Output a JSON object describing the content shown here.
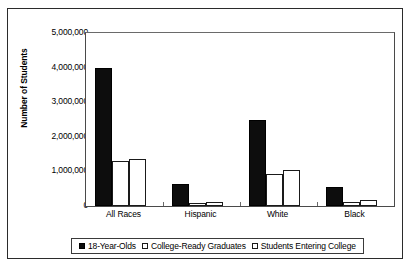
{
  "chart_data": {
    "type": "bar",
    "title": "",
    "subtitle": "",
    "xlabel": "",
    "ylabel": "Number of Students",
    "categories": [
      "All Races",
      "Hispanic",
      "White",
      "Black"
    ],
    "series": [
      {
        "name": "18-Year-Olds",
        "swatch": "filled-black-square",
        "values": [
          4000000,
          650000,
          2500000,
          550000
        ]
      },
      {
        "name": "College-Ready Graduates",
        "swatch": "dotted-white-square",
        "values": [
          1300000,
          80000,
          930000,
          130000
        ]
      },
      {
        "name": "Students Entering College",
        "swatch": "open-white-square",
        "values": [
          1350000,
          110000,
          1040000,
          180000
        ]
      }
    ],
    "ylim": [
      0,
      5000000
    ],
    "ytick_values": [
      0,
      1000000,
      2000000,
      3000000,
      4000000,
      5000000
    ],
    "ytick_labels": [
      "0",
      "1,000,000",
      "2,000,000",
      "3,000,000",
      "4,000,000",
      "5,000,000"
    ],
    "grid": false,
    "legend_position": "bottom",
    "colors": {
      "series_0": "#0d0d0d",
      "series_1": "#ffffff",
      "series_2": "#ffffff",
      "axis": "#4a4a4a",
      "text": "#000000",
      "background": "#ffffff"
    }
  }
}
